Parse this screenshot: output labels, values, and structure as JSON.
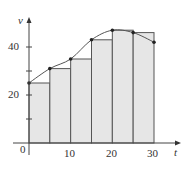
{
  "chart_data": {
    "type": "bar",
    "subtype": "riemann-sum-left-endpoint-with-curve",
    "title": "",
    "xlabel": "t",
    "ylabel": "v",
    "xlim": [
      0,
      30
    ],
    "ylim": [
      0,
      50
    ],
    "x_ticks": [
      10,
      20,
      30
    ],
    "y_ticks": [
      20,
      40
    ],
    "y_minor_ticks": [
      10,
      30
    ],
    "origin_label": "0",
    "grid": false,
    "legend": null,
    "rectangles": {
      "width": 5,
      "left_edges": [
        0,
        5,
        10,
        15,
        20,
        25
      ],
      "heights": [
        25,
        31,
        35,
        43,
        47,
        46
      ]
    },
    "curve_points": {
      "x": [
        0,
        5,
        10,
        15,
        20,
        25,
        30
      ],
      "y": [
        25,
        31,
        35,
        43,
        47,
        46,
        42
      ]
    },
    "colors": {
      "bar_fill": "#e6e6e6",
      "bar_stroke": "#555555",
      "curve": "#555555",
      "point": "#222222",
      "axis": "#444444"
    }
  },
  "labels": {
    "x_axis": "t",
    "y_axis": "v",
    "origin": "0",
    "x_tick_10": "10",
    "x_tick_20": "20",
    "x_tick_30": "30",
    "y_tick_20": "20",
    "y_tick_40": "40"
  }
}
